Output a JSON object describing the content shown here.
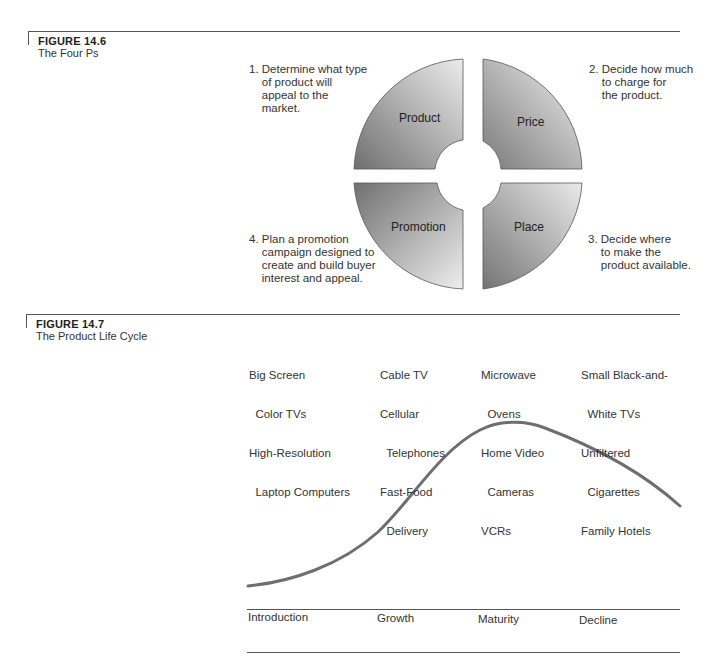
{
  "figure_14_6": {
    "number": "FIGURE 14.6",
    "title": "The Four Ps",
    "quadrants": [
      {
        "label": "Product",
        "position": "top-left"
      },
      {
        "label": "Price",
        "position": "top-right"
      },
      {
        "label": "Place",
        "position": "bottom-right"
      },
      {
        "label": "Promotion",
        "position": "bottom-left"
      }
    ],
    "notes": {
      "product": "1. Determine what type\n    of product will\n    appeal to the\n    market.",
      "price": "2. Decide how much\n    to charge for\n    the product.",
      "place": "3. Decide where\n    to make the\n    product available.",
      "promotion": "4. Plan a promotion\n    campaign designed to\n    create and build buyer\n    interest and appeal."
    },
    "colors": {
      "fill_dark": "#7a7a7a",
      "fill_light": "#e6e6e6",
      "outline": "#555555"
    }
  },
  "figure_14_7": {
    "number": "FIGURE 14.7",
    "title": "The Product Life Cycle",
    "examples": [
      {
        "stage": "Introduction",
        "items": [
          "Big Screen",
          "  Color TVs",
          "High-Resolution",
          "  Laptop Computers"
        ]
      },
      {
        "stage": "Growth",
        "items": [
          "Cable TV",
          "Cellular",
          "  Telephones",
          "Fast-Food",
          "  Delivery"
        ]
      },
      {
        "stage": "Maturity",
        "items": [
          "Microwave",
          "  Ovens",
          "Home Video",
          "  Cameras",
          "VCRs"
        ]
      },
      {
        "stage": "Decline",
        "items": [
          "Small Black-and-",
          "  White TVs",
          "Unfiltered",
          "  Cigarettes",
          "Family Hotels"
        ]
      }
    ],
    "stages": [
      "Introduction",
      "Growth",
      "Maturity",
      "Decline"
    ],
    "curve_color": "#6e6e6e"
  }
}
